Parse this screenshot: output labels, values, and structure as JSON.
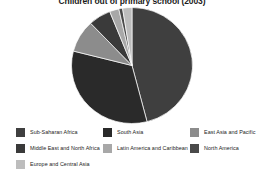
{
  "chart_data": {
    "type": "pie",
    "title": "Children out of primary school (2003)",
    "subtitle": "",
    "xlabel": "",
    "ylabel": "",
    "legend_position": "bottom",
    "grid": false,
    "start_angle_deg": 0,
    "direction": "clockwise",
    "categories": [
      "Sub-Saharan Africa",
      "South Asia",
      "East Asia and Pacific",
      "Middle East and North Africa",
      "Latin America and Caribbean",
      "North America",
      "Europe and Central Asia"
    ],
    "values": [
      46,
      33,
      9,
      6,
      2.5,
      1,
      2.5
    ],
    "colors": [
      "#3f3f3f",
      "#2a2a2a",
      "#8c8c8c",
      "#3a3a3a",
      "#a8a8a8",
      "#4a4a4a",
      "#bdbdbd"
    ],
    "slices": [
      {
        "label": "Sub-Saharan Africa",
        "value": 46,
        "color": "#3f3f3f"
      },
      {
        "label": "South Asia",
        "value": 33,
        "color": "#2a2a2a"
      },
      {
        "label": "East Asia and Pacific",
        "value": 9,
        "color": "#8c8c8c"
      },
      {
        "label": "Middle East and North Africa",
        "value": 6,
        "color": "#3a3a3a"
      },
      {
        "label": "Latin America and Caribbean",
        "value": 2.5,
        "color": "#a8a8a8"
      },
      {
        "label": "North America",
        "value": 1,
        "color": "#4a4a4a"
      },
      {
        "label": "Europe and Central Asia",
        "value": 2.5,
        "color": "#bdbdbd"
      }
    ]
  },
  "legend": {
    "items": [
      {
        "label": "Sub-Saharan Africa",
        "color": "#3f3f3f"
      },
      {
        "label": "South Asia",
        "color": "#2a2a2a"
      },
      {
        "label": "East Asia and Pacific",
        "color": "#8c8c8c"
      },
      {
        "label": "Middle East and North Africa",
        "color": "#3a3a3a"
      },
      {
        "label": "Latin America and Caribbean",
        "color": "#a8a8a8"
      },
      {
        "label": "North America",
        "color": "#4a4a4a"
      },
      {
        "label": "Europe and Central Asia",
        "color": "#bdbdbd"
      }
    ]
  }
}
